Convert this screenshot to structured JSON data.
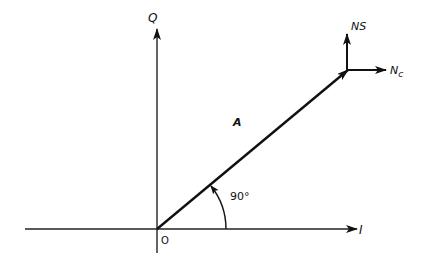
{
  "diagram": {
    "type": "phasor-diagram",
    "axes": {
      "horizontal": {
        "label": "I"
      },
      "vertical": {
        "label": "Q"
      },
      "origin_label": "O"
    },
    "vector": {
      "label": "A"
    },
    "angle": {
      "label": "90°"
    },
    "noise_components": {
      "sine": {
        "label": "NS"
      },
      "cosine": {
        "label_main": "N",
        "label_sub": "c"
      }
    },
    "colors": {
      "stroke": "#111111",
      "background": "#ffffff"
    }
  }
}
